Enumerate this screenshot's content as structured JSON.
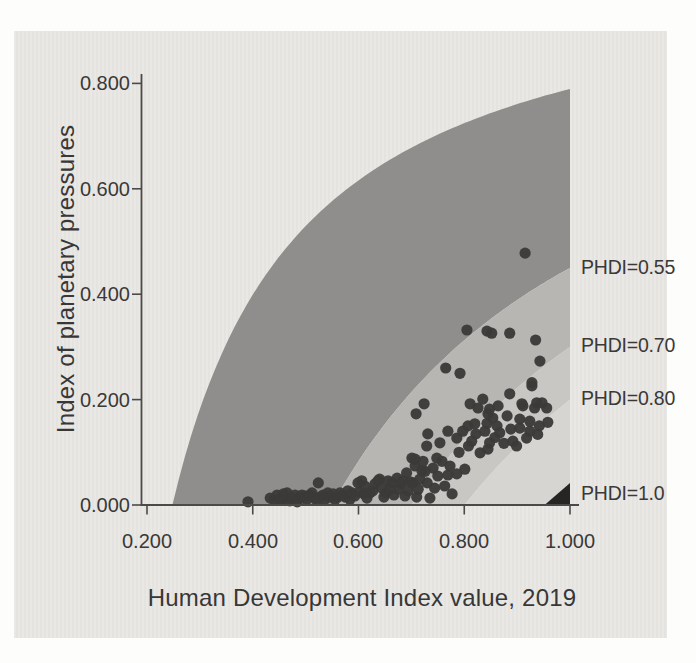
{
  "page": {
    "background": "#fdfdfc",
    "panel_color": "#e9e7e4"
  },
  "chart_data": {
    "type": "scatter",
    "title": "",
    "xlabel": "Human Development Index value, 2019",
    "ylabel": "Index of planetary pressures",
    "xlim": [
      0.2,
      1.0
    ],
    "ylim": [
      0.0,
      0.8
    ],
    "grid": false,
    "legend_position": "right-edge-labels",
    "axis_color": "#4b4a48",
    "text_color": "#3a3938",
    "point_color": "#3b3a38",
    "point_radius": 5.6,
    "x_ticks": [
      {
        "v": 0.2,
        "label": "0.200"
      },
      {
        "v": 0.4,
        "label": "0.400"
      },
      {
        "v": 0.6,
        "label": "0.600"
      },
      {
        "v": 0.8,
        "label": "0.800"
      },
      {
        "v": 1.0,
        "label": "1.000"
      }
    ],
    "y_ticks": [
      {
        "v": 0.0,
        "label": "0.000"
      },
      {
        "v": 0.2,
        "label": "0.200"
      },
      {
        "v": 0.4,
        "label": "0.400"
      },
      {
        "v": 0.6,
        "label": "0.600"
      },
      {
        "v": 0.8,
        "label": "0.800"
      }
    ],
    "bands": [
      {
        "name": "band-phdi-below-0.55",
        "upper_c": 0.248,
        "upper_k": 1.05,
        "lower_c": 0.55,
        "color": "#8f8e8c"
      },
      {
        "name": "band-phdi-0.55-0.70",
        "upper_c": 0.55,
        "upper_k": 1.0,
        "lower_c": 0.7,
        "color": "#b8b6b3"
      },
      {
        "name": "band-phdi-0.70-0.80",
        "upper_c": 0.7,
        "upper_k": 1.0,
        "lower_c": 0.8,
        "color": "#c9c7c4"
      },
      {
        "name": "band-phdi-0.80-1.0",
        "upper_c": 0.8,
        "upper_k": 1.0,
        "lower_c": null,
        "color": "#d7d5d2"
      }
    ],
    "iso_labels": [
      {
        "text": "PHDI=0.55",
        "p": 0.451
      },
      {
        "text": "PHDI=0.70",
        "p": 0.304
      },
      {
        "text": "PHDI=0.80",
        "p": 0.203
      },
      {
        "text": "PHDI=1.0",
        "p": 0.022
      }
    ],
    "max_triangle": {
      "points": [
        [
          0.952,
          0.0
        ],
        [
          1.0,
          0.0
        ],
        [
          1.0,
          0.042
        ]
      ],
      "color": "#262523"
    },
    "points": [
      [
        0.391,
        0.006
      ],
      [
        0.433,
        0.013
      ],
      [
        0.44,
        0.009
      ],
      [
        0.446,
        0.019
      ],
      [
        0.452,
        0.011
      ],
      [
        0.455,
        0.009
      ],
      [
        0.458,
        0.021
      ],
      [
        0.461,
        0.015
      ],
      [
        0.465,
        0.023
      ],
      [
        0.47,
        0.008
      ],
      [
        0.474,
        0.013
      ],
      [
        0.48,
        0.019
      ],
      [
        0.484,
        0.006
      ],
      [
        0.489,
        0.013
      ],
      [
        0.493,
        0.019
      ],
      [
        0.499,
        0.017
      ],
      [
        0.502,
        0.011
      ],
      [
        0.508,
        0.019
      ],
      [
        0.512,
        0.023
      ],
      [
        0.517,
        0.013
      ],
      [
        0.521,
        0.009
      ],
      [
        0.524,
        0.042
      ],
      [
        0.527,
        0.015
      ],
      [
        0.533,
        0.019
      ],
      [
        0.536,
        0.011
      ],
      [
        0.542,
        0.023
      ],
      [
        0.546,
        0.015
      ],
      [
        0.552,
        0.021
      ],
      [
        0.556,
        0.011
      ],
      [
        0.561,
        0.015
      ],
      [
        0.565,
        0.023
      ],
      [
        0.57,
        0.019
      ],
      [
        0.575,
        0.015
      ],
      [
        0.58,
        0.027
      ],
      [
        0.584,
        0.011
      ],
      [
        0.588,
        0.023
      ],
      [
        0.593,
        0.017
      ],
      [
        0.599,
        0.042
      ],
      [
        0.602,
        0.025
      ],
      [
        0.606,
        0.046
      ],
      [
        0.61,
        0.021
      ],
      [
        0.612,
        0.036
      ],
      [
        0.616,
        0.013
      ],
      [
        0.622,
        0.023
      ],
      [
        0.627,
        0.027
      ],
      [
        0.631,
        0.04
      ],
      [
        0.637,
        0.046
      ],
      [
        0.64,
        0.049
      ],
      [
        0.644,
        0.032
      ],
      [
        0.648,
        0.015
      ],
      [
        0.652,
        0.023
      ],
      [
        0.656,
        0.046
      ],
      [
        0.66,
        0.03
      ],
      [
        0.663,
        0.042
      ],
      [
        0.667,
        0.019
      ],
      [
        0.673,
        0.051
      ],
      [
        0.676,
        0.03
      ],
      [
        0.68,
        0.04
      ],
      [
        0.684,
        0.046
      ],
      [
        0.688,
        0.017
      ],
      [
        0.691,
        0.061
      ],
      [
        0.694,
        0.027
      ],
      [
        0.698,
        0.044
      ],
      [
        0.703,
        0.042
      ],
      [
        0.707,
        0.074
      ],
      [
        0.71,
        0.015
      ],
      [
        0.713,
        0.03
      ],
      [
        0.716,
        0.049
      ],
      [
        0.72,
        0.065
      ],
      [
        0.726,
        0.064
      ],
      [
        0.73,
        0.042
      ],
      [
        0.735,
        0.013
      ],
      [
        0.741,
        0.07
      ],
      [
        0.744,
        0.032
      ],
      [
        0.75,
        0.055
      ],
      [
        0.758,
        0.083
      ],
      [
        0.763,
        0.036
      ],
      [
        0.769,
        0.057
      ],
      [
        0.773,
        0.074
      ],
      [
        0.777,
        0.021
      ],
      [
        0.786,
        0.059
      ],
      [
        0.801,
        0.068
      ],
      [
        0.701,
        0.089
      ],
      [
        0.707,
        0.087
      ],
      [
        0.709,
        0.173
      ],
      [
        0.722,
        0.083
      ],
      [
        0.724,
        0.192
      ],
      [
        0.729,
        0.112
      ],
      [
        0.731,
        0.135
      ],
      [
        0.748,
        0.089
      ],
      [
        0.754,
        0.118
      ],
      [
        0.769,
        0.14
      ],
      [
        0.786,
        0.127
      ],
      [
        0.79,
        0.1
      ],
      [
        0.797,
        0.14
      ],
      [
        0.807,
        0.15
      ],
      [
        0.808,
        0.112
      ],
      [
        0.811,
        0.192
      ],
      [
        0.814,
        0.121
      ],
      [
        0.82,
        0.154
      ],
      [
        0.822,
        0.135
      ],
      [
        0.826,
        0.184
      ],
      [
        0.83,
        0.099
      ],
      [
        0.835,
        0.201
      ],
      [
        0.839,
        0.14
      ],
      [
        0.843,
        0.155
      ],
      [
        0.845,
        0.106
      ],
      [
        0.845,
        0.173
      ],
      [
        0.848,
        0.118
      ],
      [
        0.848,
        0.182
      ],
      [
        0.854,
        0.165
      ],
      [
        0.858,
        0.128
      ],
      [
        0.862,
        0.15
      ],
      [
        0.864,
        0.188
      ],
      [
        0.867,
        0.137
      ],
      [
        0.875,
        0.117
      ],
      [
        0.881,
        0.169
      ],
      [
        0.886,
        0.211
      ],
      [
        0.888,
        0.144
      ],
      [
        0.892,
        0.121
      ],
      [
        0.899,
        0.112
      ],
      [
        0.905,
        0.146
      ],
      [
        0.905,
        0.163
      ],
      [
        0.909,
        0.192
      ],
      [
        0.911,
        0.188
      ],
      [
        0.918,
        0.127
      ],
      [
        0.924,
        0.14
      ],
      [
        0.924,
        0.159
      ],
      [
        0.928,
        0.226
      ],
      [
        0.933,
        0.184
      ],
      [
        0.937,
        0.194
      ],
      [
        0.939,
        0.134
      ],
      [
        0.942,
        0.15
      ],
      [
        0.947,
        0.194
      ],
      [
        0.956,
        0.184
      ],
      [
        0.958,
        0.157
      ],
      [
        0.765,
        0.26
      ],
      [
        0.792,
        0.25
      ],
      [
        0.928,
        0.232
      ],
      [
        0.943,
        0.273
      ],
      [
        0.805,
        0.332
      ],
      [
        0.843,
        0.33
      ],
      [
        0.852,
        0.326
      ],
      [
        0.886,
        0.326
      ],
      [
        0.935,
        0.313
      ],
      [
        0.915,
        0.478
      ]
    ]
  }
}
